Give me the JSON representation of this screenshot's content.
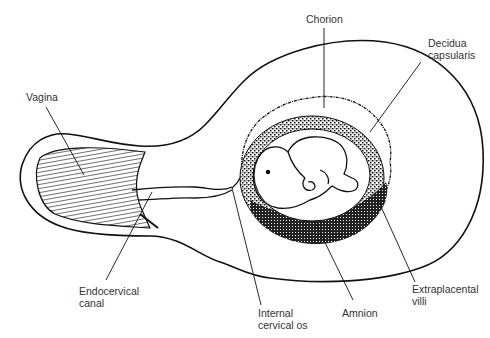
{
  "diagram": {
    "colors": {
      "ink": "#111111",
      "label_text": "#333333",
      "background": "#ffffff"
    },
    "labels": {
      "vagina": "Vagina",
      "chorion": "Chorion",
      "decidua_capsularis_line1": "Decidua",
      "decidua_capsularis_line2": "capsularis",
      "endocervical_canal_line1": "Endocervical",
      "endocervical_canal_line2": "canal",
      "internal_cervical_os_line1": "Internal",
      "internal_cervical_os_line2": "cervical os",
      "amnion": "Amnion",
      "extraplacental_villi_line1": "Extraplacental",
      "extraplacental_villi_line2": "villi"
    },
    "structures": [
      "uterus-outline",
      "vagina",
      "cervix-endocervical-canal",
      "decidua-capsularis",
      "chorion",
      "extraplacental-villi",
      "amnion",
      "embryo"
    ]
  }
}
